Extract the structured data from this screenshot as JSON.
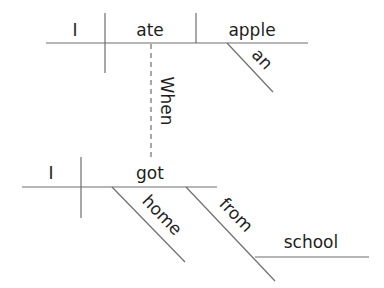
{
  "diagram": {
    "type": "sentence-diagram",
    "sentence": "When I got home from school, I ate an apple",
    "main_clause": {
      "subject": "I",
      "verb": "ate",
      "object": "apple",
      "modifier": "an"
    },
    "connector": "When",
    "sub_clause": {
      "subject": "I",
      "verb": "got",
      "adverb": "home",
      "preposition": "from",
      "prep_object": "school"
    },
    "colors": {
      "line": "#6e6e6e",
      "text": "#1e1e1e",
      "background": "#ffffff"
    }
  }
}
